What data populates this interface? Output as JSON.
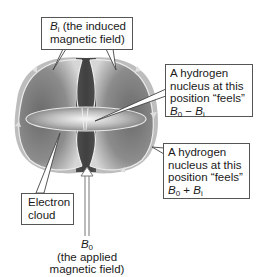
{
  "figure": {
    "labels": {
      "induced_field": {
        "symbol": "B",
        "sub": "i",
        "text_line1": " (the induced",
        "text_line2": "magnetic field)"
      },
      "nucleus_minus": {
        "line1": "A hydrogen",
        "line2": "nucleus at this",
        "line3": "position “feels”",
        "eq_b": "B",
        "eq_sub0": "0",
        "eq_op": " − ",
        "eq_b2": "B",
        "eq_sub1": "i"
      },
      "nucleus_plus": {
        "line1": "A hydrogen",
        "line2": "nucleus at this",
        "line3": "position “feels”",
        "eq_b": "B",
        "eq_sub0": "0",
        "eq_op": " + ",
        "eq_b2": "B",
        "eq_sub1": "i"
      },
      "electron_cloud": {
        "line1": "Electron",
        "line2": "cloud"
      },
      "applied_field": {
        "symbol": "B",
        "sub": "0",
        "line1": "(the applied",
        "line2": "magnetic field)"
      }
    },
    "colors": {
      "cloud_dark": "#4a4a4a",
      "cloud_light": "#d8d8d8",
      "field_lines": "#e6e6e6",
      "box_border": "#555555"
    }
  }
}
